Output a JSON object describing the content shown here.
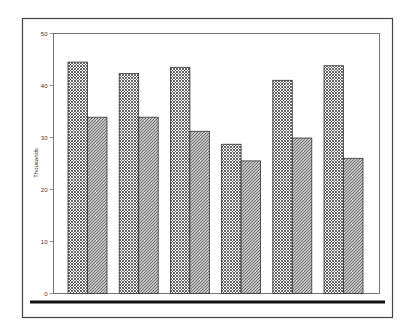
{
  "chart_data": {
    "type": "bar",
    "title": "",
    "xlabel": "",
    "ylabel": "Thousands",
    "ylim": [
      0,
      50
    ],
    "yticks": [
      0,
      10,
      20,
      30,
      40,
      50
    ],
    "grid": false,
    "legend": null,
    "categories": [
      "1",
      "2",
      "3",
      "4",
      "5",
      "6"
    ],
    "category_labels_visible": false,
    "series": [
      {
        "name": "Series 1",
        "pattern": "crosshatch",
        "values": [
          44.5,
          42.3,
          43.5,
          28.7,
          41.0,
          43.8
        ]
      },
      {
        "name": "Series 2",
        "pattern": "diagonal",
        "values": [
          33.9,
          33.9,
          31.2,
          25.5,
          29.9,
          26.0
        ]
      }
    ]
  },
  "colors": {
    "background": "#ffffff",
    "frame": "#444444",
    "bar_outline": "#333333",
    "pattern_ink": "#555555",
    "baseline_bar": "#111111"
  }
}
